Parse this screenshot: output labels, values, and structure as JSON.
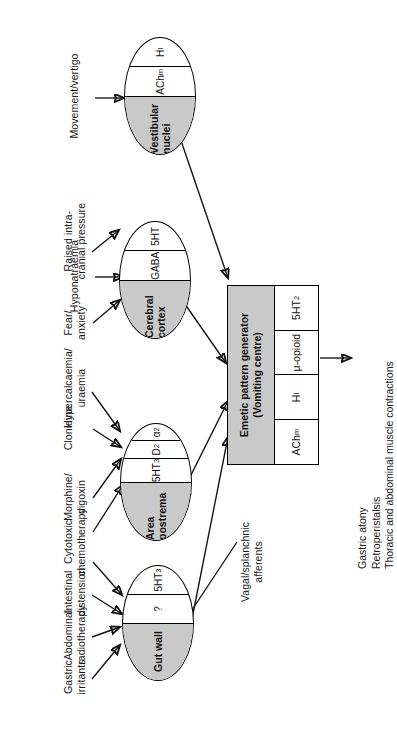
{
  "figure": {
    "orientation": "rotated-90-ccw"
  },
  "organs": [
    {
      "id": "vestibular-nuclei",
      "name": "Vestibular nuclei",
      "receptors": [
        "AChm",
        "H1"
      ],
      "receptor_display": [
        "ACh",
        "H"
      ],
      "receptor_subscripts": [
        "m",
        "I"
      ],
      "inputs": [
        "Movement/vertigo"
      ]
    },
    {
      "id": "cerebral-cortex",
      "name": "Cerebral cortex",
      "receptors": [
        "GABA",
        "5HT"
      ],
      "inputs": [
        "Raised intra-\ncranial pressure",
        "Hyponatraemia",
        "Fear/\nanxiety"
      ]
    },
    {
      "id": "area-postrema",
      "name": "Area postrema",
      "receptors": [
        "5HT3",
        "D2",
        "a2"
      ],
      "inputs": [
        "Hypercalcaemia/\nuraemia",
        "Clonidine",
        "Morphine/\ndigoxin",
        "Cytotoxic\nchemotherapy"
      ]
    },
    {
      "id": "gut-wall",
      "name": "Gut wall",
      "receptors": [
        "?",
        "5HT3"
      ],
      "inputs": [
        "Gastric\nirritants",
        "Abdominal\nradiotherapy",
        "Intestinal\ndistension",
        "Cytotoxic\nchemotherapy"
      ]
    }
  ],
  "inputs": {
    "movement_vertigo": "Movement/vertigo",
    "raised_icp": "Raised intra-\ncranial pressure",
    "hyponatraemia": "Hyponatraemia",
    "fear_anxiety": "Fear/\nanxiety",
    "hypercalcaemia_uraemia": "Hypercalcaemia/\nuraemia",
    "clonidine": "Clonidine",
    "morphine_digoxin": "Morphine/\ndigoxin",
    "cytotoxic_chemotherapy": "Cytotoxic\nchemotherapy",
    "intestinal_distension": "Intestinal\ndistension",
    "abdominal_radiotherapy": "Abdominal\nradiotherapy",
    "gastric_irritants": "Gastric\nirritants"
  },
  "pathways": {
    "vagal_splanchnic": "Vagal/splanchnic\nafferents"
  },
  "vomiting_centre": {
    "title": "Emetic pattern generator\n(Vomiting centre)",
    "receptors": [
      "AChm",
      "H1",
      "mu-opioid",
      "5HT2"
    ],
    "receptor_labels": [
      "ACh",
      "H",
      "μ-opioid",
      "5HT"
    ],
    "receptor_subscripts": [
      "m",
      "I",
      "",
      "2"
    ]
  },
  "outputs": {
    "lines": [
      "Gastric atony",
      "Retroperistalsis",
      "Thoracic and abdominal muscle contractions"
    ],
    "text": "Gastric atony\nRetroperistalsis\nThoracic and abdominal muscle contractions"
  },
  "colors": {
    "shade": "#c9c9c9",
    "stroke": "#111111",
    "background": "#ffffff",
    "text": "#1a1a1a"
  }
}
